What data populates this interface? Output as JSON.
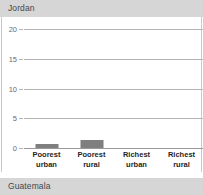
{
  "header": {
    "title": "Jordan"
  },
  "footer": {
    "title": "Guatemala"
  },
  "colors": {
    "bar": "#7f7f7f",
    "gridline": "#b4b4b4",
    "axis": "#9a9a9a",
    "header_band": "#d6d6d6",
    "tick_text": "#6a6a6a",
    "label_text": "#1f1f1f"
  },
  "chart_data": {
    "type": "bar",
    "title": "Jordan",
    "xlabel": "",
    "ylabel": "",
    "categories": [
      "Poorest urban",
      "Poorest rural",
      "Richest urban",
      "Richest rural"
    ],
    "category_lines": [
      [
        "Poorest",
        "urban"
      ],
      [
        "Poorest",
        "rural"
      ],
      [
        "Richest",
        "urban"
      ],
      [
        "Richest",
        "rural"
      ]
    ],
    "values": [
      0.7,
      1.3,
      0.0,
      0.0
    ],
    "ylim": [
      0,
      20
    ],
    "yticks": [
      0,
      5,
      10,
      15,
      20
    ],
    "ytick_labels": [
      "0",
      "5",
      "10",
      "15",
      "20"
    ],
    "grid": true,
    "legend": "none"
  }
}
